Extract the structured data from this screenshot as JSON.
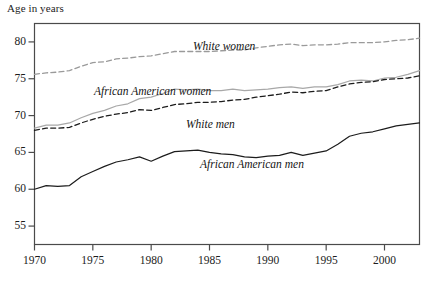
{
  "chart_data": {
    "type": "line",
    "title": "",
    "xlabel": "",
    "ylabel": "Age in years",
    "xlim": [
      1970,
      2003
    ],
    "ylim": [
      52.5,
      82.5
    ],
    "grid": false,
    "legend_position": "inline-annotations",
    "xticks": [
      1970,
      1975,
      1980,
      1985,
      1990,
      1995,
      2000
    ],
    "yticks": [
      55,
      60,
      65,
      70,
      75,
      80
    ],
    "x": [
      1970,
      1971,
      1972,
      1973,
      1974,
      1975,
      1976,
      1977,
      1978,
      1979,
      1980,
      1981,
      1982,
      1983,
      1984,
      1985,
      1986,
      1987,
      1988,
      1989,
      1990,
      1991,
      1992,
      1993,
      1994,
      1995,
      1996,
      1997,
      1998,
      1999,
      2000,
      2001,
      2002,
      2003
    ],
    "series": [
      {
        "name": "White women",
        "style": "dashed",
        "color": "#9a9a9a",
        "values": [
          75.6,
          75.8,
          75.9,
          76.1,
          76.7,
          77.2,
          77.3,
          77.7,
          77.8,
          78.0,
          78.1,
          78.4,
          78.7,
          78.7,
          78.7,
          78.7,
          78.8,
          78.9,
          78.9,
          79.2,
          79.4,
          79.6,
          79.7,
          79.5,
          79.6,
          79.6,
          79.7,
          79.9,
          79.9,
          79.9,
          80.0,
          80.2,
          80.3,
          80.5
        ]
      },
      {
        "name": "African American women",
        "style": "solid",
        "color": "#a8a8a8",
        "values": [
          68.3,
          68.7,
          68.7,
          69.0,
          69.7,
          70.3,
          70.7,
          71.3,
          71.6,
          72.3,
          72.5,
          73.0,
          73.6,
          73.5,
          73.6,
          73.4,
          73.4,
          73.6,
          73.4,
          73.5,
          73.6,
          73.8,
          73.9,
          73.7,
          73.9,
          73.9,
          74.2,
          74.7,
          74.8,
          74.7,
          75.1,
          75.2,
          75.6,
          76.1
        ]
      },
      {
        "name": "White men",
        "style": "dashed",
        "color": "#1c1c1c",
        "values": [
          68.0,
          68.3,
          68.3,
          68.4,
          69.0,
          69.5,
          69.9,
          70.2,
          70.4,
          70.8,
          70.7,
          71.1,
          71.5,
          71.6,
          71.8,
          71.8,
          71.9,
          72.1,
          72.2,
          72.5,
          72.7,
          72.9,
          73.2,
          73.1,
          73.3,
          73.4,
          73.9,
          74.3,
          74.5,
          74.6,
          74.9,
          75.0,
          75.1,
          75.4
        ]
      },
      {
        "name": "African American men",
        "style": "solid",
        "color": "#1c1c1c",
        "values": [
          60.0,
          60.5,
          60.4,
          60.5,
          61.7,
          62.4,
          63.1,
          63.7,
          64.0,
          64.4,
          63.8,
          64.5,
          65.1,
          65.2,
          65.3,
          65.0,
          64.8,
          64.7,
          64.4,
          64.3,
          64.5,
          64.6,
          65.0,
          64.6,
          64.9,
          65.2,
          66.1,
          67.2,
          67.6,
          67.8,
          68.2,
          68.6,
          68.8,
          69.0
        ]
      }
    ],
    "annotations": [
      {
        "text": "White women",
        "x_px": 193,
        "y_px": 40
      },
      {
        "text": "African American women",
        "x_px": 94,
        "y_px": 85
      },
      {
        "text": "White men",
        "x_px": 186,
        "y_px": 118
      },
      {
        "text": "African American men",
        "x_px": 200,
        "y_px": 158
      }
    ]
  }
}
